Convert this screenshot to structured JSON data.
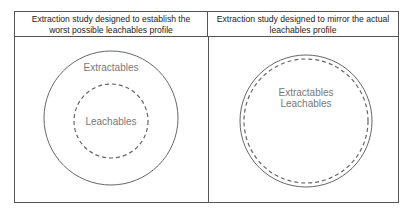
{
  "columns": [
    {
      "header": "Extraction study designed to establish the worst possible leachables profile",
      "header_line1": "Extraction study designed to establish the",
      "header_line2": "worst possible leachables profile",
      "outer_label": "Extractables",
      "inner_label": "Leachables"
    },
    {
      "header": "Extraction study designed to mirror the actual leachables profile",
      "header_line1": "Extraction study designed to mirror the actual",
      "header_line2": "leachables profile",
      "label1": "Extractables",
      "label2": "Leachables"
    }
  ],
  "colors": {
    "border": "#555555",
    "circle": "#666666",
    "text": "#777777"
  }
}
